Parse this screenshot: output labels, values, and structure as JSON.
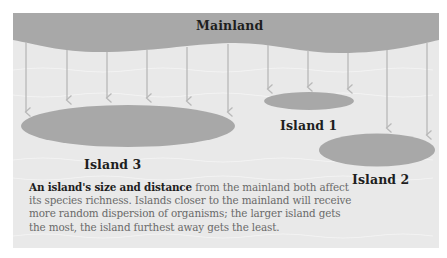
{
  "colors": {
    "background": "#ffffff",
    "water": "#e9e9e9",
    "water_wave": "#f3f3f3",
    "land": "#a8a8a8",
    "arrow": "#b9b9b9",
    "label_text": "#1e1e1e",
    "caption_text": "#6a6a6a"
  },
  "mainland": {
    "label": "Mainland"
  },
  "islands": [
    {
      "name": "Island 1",
      "label": "Island 1",
      "size": "small",
      "distance": "near"
    },
    {
      "name": "Island 2",
      "label": "Island 2",
      "size": "medium",
      "distance": "far"
    },
    {
      "name": "Island 3",
      "label": "Island 3",
      "size": "large",
      "distance": "near"
    }
  ],
  "arrows": {
    "count": 11,
    "meaning": "random dispersion of organisms from mainland"
  },
  "caption": {
    "bold_lead": "An island's size and distance",
    "text": " from the mainland both affect its species richness. Islands closer to the mainland will receive more random dispersion of organisms; the larger island gets the most, the island furthest away gets the least."
  }
}
